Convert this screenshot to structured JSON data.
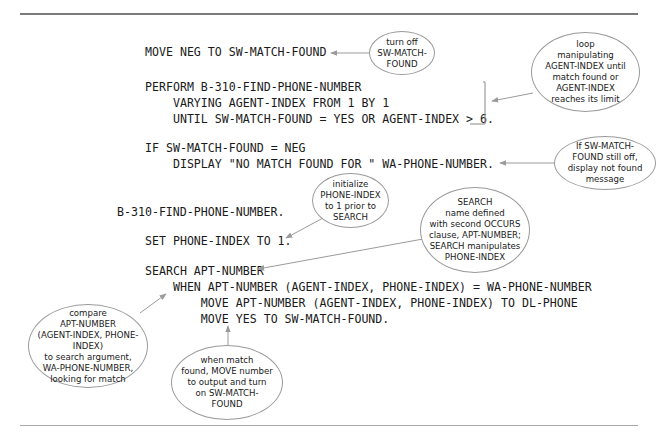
{
  "code_lines": {
    "move_neg": "MOVE NEG TO SW-MATCH-FOUND",
    "perform": "PERFORM B-310-FIND-PHONE-NUMBER",
    "varying": "    VARYING AGENT-INDEX FROM 1 BY 1",
    "until": "    UNTIL SW-MATCH-FOUND = YES OR AGENT-INDEX > 6.",
    "if_line": "IF SW-MATCH-FOUND = NEG",
    "display_line": "    DISPLAY \"NO MATCH FOUND FOR \" WA-PHONE-NUMBER.",
    "paragraph": "B-310-FIND-PHONE-NUMBER.",
    "set_line": "SET PHONE-INDEX TO 1.",
    "search_line": "SEARCH APT-NUMBER",
    "when_line": "    WHEN APT-NUMBER (AGENT-INDEX, PHONE-INDEX) = WA-PHONE-NUMBER",
    "move_apt": "        MOVE APT-NUMBER (AGENT-INDEX, PHONE-INDEX) TO DL-PHONE",
    "move_yes": "        MOVE YES TO SW-MATCH-FOUND."
  },
  "annotations": {
    "turn_off": "turn off\nSW-MATCH-\nFOUND",
    "loop": "loop\nmanipulating\nAGENT-INDEX until\nmatch found or\nAGENT-INDEX\nreaches its limit",
    "not_found": "If SW-MATCH-\nFOUND still off,\ndisplay not found\nmessage",
    "initialize": "initialize\nPHONE-INDEX\nto 1 prior to\nSEARCH",
    "search_name": "SEARCH\nname defined\nwith second OCCURS\nclause, APT-NUMBER;\nSEARCH manipulates\nPHONE-INDEX",
    "compare": "compare\nAPT-NUMBER\n(AGENT-INDEX, PHONE-INDEX)\nto search argument,\nWA-PHONE-NUMBER,\nlooking for match",
    "when_match": "when match\nfound, MOVE number\nto output and turn\non SW-MATCH-\nFOUND"
  },
  "colors": {
    "text": "#1a1a1a",
    "arrow": "#999999",
    "bubble_border": "#9a9a9a",
    "rule": "#7a7a7a"
  }
}
